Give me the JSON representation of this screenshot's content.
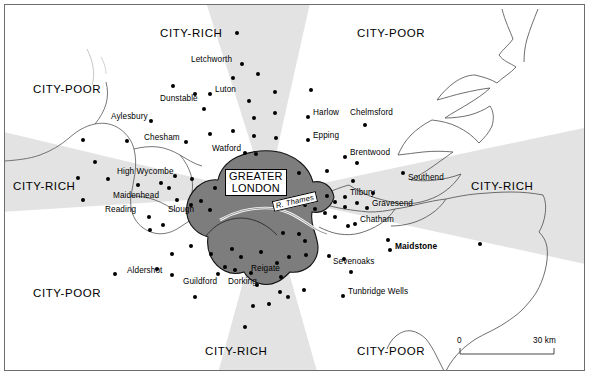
{
  "map": {
    "title": "Greater London and surrounding region — city-rich / city-poor sectors",
    "core_label_line1": "GREATER",
    "core_label_line2": "LONDON",
    "river_label": "R. Thames",
    "colors": {
      "sector_shaded": "#e3e3e3",
      "sector_plain": "#ffffff",
      "core_fill": "#7d7d7d",
      "coastline": "#555555",
      "dot": "#000000",
      "frame": "#6d6d6d"
    },
    "sector_labels": [
      {
        "text": "CITY-RICH",
        "x": 155,
        "y": 22,
        "name": "sector-label-north-city-rich"
      },
      {
        "text": "CITY-POOR",
        "x": 352,
        "y": 22,
        "name": "sector-label-northeast-city-poor"
      },
      {
        "text": "CITY-POOR",
        "x": 28,
        "y": 78,
        "name": "sector-label-northwest-city-poor"
      },
      {
        "text": "CITY-RICH",
        "x": 8,
        "y": 175,
        "name": "sector-label-west-city-rich"
      },
      {
        "text": "CITY-RICH",
        "x": 466,
        "y": 175,
        "name": "sector-label-east-city-rich"
      },
      {
        "text": "CITY-POOR",
        "x": 28,
        "y": 282,
        "name": "sector-label-southwest-city-poor"
      },
      {
        "text": "CITY-RICH",
        "x": 200,
        "y": 340,
        "name": "sector-label-south-city-rich"
      },
      {
        "text": "CITY-POOR",
        "x": 352,
        "y": 340,
        "name": "sector-label-southeast-city-poor"
      }
    ],
    "towns": [
      {
        "name": "Letchworth",
        "lx": 186,
        "ly": 55,
        "dx": 237,
        "dy": 59,
        "align": "right",
        "bold": false
      },
      {
        "name": "Luton",
        "lx": 210,
        "ly": 85,
        "dx": 205,
        "dy": 89,
        "align": "left",
        "bold": false
      },
      {
        "name": "Dunstable",
        "lx": 155,
        "ly": 94,
        "dx": 190,
        "dy": 89,
        "align": "left",
        "bold": false
      },
      {
        "name": "Aylesbury",
        "lx": 106,
        "ly": 112,
        "dx": 146,
        "dy": 116,
        "align": "right",
        "bold": false
      },
      {
        "name": "Chesham",
        "lx": 139,
        "ly": 133,
        "dx": 181,
        "dy": 137,
        "align": "right",
        "bold": false
      },
      {
        "name": "Watford",
        "lx": 207,
        "ly": 144,
        "dx": 240,
        "dy": 148,
        "align": "right",
        "bold": false
      },
      {
        "name": "High Wycombe",
        "lx": 112,
        "ly": 167,
        "dx": 170,
        "dy": 171,
        "align": "left",
        "bold": false
      },
      {
        "name": "Maidenhead",
        "lx": 108,
        "ly": 191,
        "dx": 172,
        "dy": 195,
        "align": "right",
        "bold": false
      },
      {
        "name": "Reading",
        "lx": 100,
        "ly": 205,
        "dx": 144,
        "dy": 212,
        "align": "left",
        "bold": false
      },
      {
        "name": "Slough",
        "lx": 163,
        "ly": 205,
        "dx": 186,
        "dy": 200,
        "align": "left",
        "bold": false
      },
      {
        "name": "Aldershot",
        "lx": 122,
        "ly": 266,
        "dx": 167,
        "dy": 270,
        "align": "right",
        "bold": false
      },
      {
        "name": "Guildford",
        "lx": 178,
        "ly": 277,
        "dx": 213,
        "dy": 269,
        "align": "left",
        "bold": false
      },
      {
        "name": "Dorking",
        "lx": 223,
        "ly": 277,
        "dx": 246,
        "dy": 268,
        "align": "left",
        "bold": false
      },
      {
        "name": "Reigate",
        "lx": 246,
        "ly": 264,
        "dx": 272,
        "dy": 258,
        "align": "left",
        "bold": false
      },
      {
        "name": "Harlow",
        "lx": 308,
        "ly": 108,
        "dx": 303,
        "dy": 112,
        "align": "left",
        "bold": false
      },
      {
        "name": "Epping",
        "lx": 308,
        "ly": 131,
        "dx": 303,
        "dy": 135,
        "align": "left",
        "bold": false
      },
      {
        "name": "Chelmsford",
        "lx": 345,
        "ly": 108,
        "dx": 360,
        "dy": 120,
        "align": "left",
        "bold": false
      },
      {
        "name": "Brentwood",
        "lx": 345,
        "ly": 148,
        "dx": 340,
        "dy": 152,
        "align": "left",
        "bold": false
      },
      {
        "name": "Southend",
        "lx": 403,
        "ly": 173,
        "dx": 398,
        "dy": 168,
        "align": "left",
        "bold": false
      },
      {
        "name": "Tilbury",
        "lx": 345,
        "ly": 188,
        "dx": 340,
        "dy": 192,
        "align": "left",
        "bold": false
      },
      {
        "name": "Gravesend",
        "lx": 367,
        "ly": 199,
        "dx": 362,
        "dy": 203,
        "align": "left",
        "bold": false
      },
      {
        "name": "Chatham",
        "lx": 355,
        "ly": 215,
        "dx": 350,
        "dy": 219,
        "align": "left",
        "bold": false
      },
      {
        "name": "Maistone-marker",
        "lx": 0,
        "ly": 0,
        "dx": 383,
        "dy": 235,
        "align": "none",
        "bold": false
      },
      {
        "name": "Maidstone",
        "lx": 390,
        "ly": 241,
        "dx": 385,
        "dy": 245,
        "align": "left",
        "bold": true
      },
      {
        "name": "Sevenoaks",
        "lx": 328,
        "ly": 257,
        "dx": 324,
        "dy": 251,
        "align": "left",
        "bold": false
      },
      {
        "name": "Tunbridge Wells",
        "lx": 343,
        "ly": 287,
        "dx": 338,
        "dy": 291,
        "align": "left",
        "bold": false
      }
    ],
    "extra_dots": [
      {
        "x": 232,
        "y": 28
      },
      {
        "x": 253,
        "y": 69
      },
      {
        "x": 228,
        "y": 73
      },
      {
        "x": 168,
        "y": 81
      },
      {
        "x": 199,
        "y": 104
      },
      {
        "x": 270,
        "y": 87
      },
      {
        "x": 249,
        "y": 113
      },
      {
        "x": 205,
        "y": 129
      },
      {
        "x": 228,
        "y": 126
      },
      {
        "x": 249,
        "y": 131
      },
      {
        "x": 270,
        "y": 108
      },
      {
        "x": 251,
        "y": 149
      },
      {
        "x": 271,
        "y": 133
      },
      {
        "x": 244,
        "y": 96
      },
      {
        "x": 122,
        "y": 136
      },
      {
        "x": 78,
        "y": 135
      },
      {
        "x": 90,
        "y": 157
      },
      {
        "x": 73,
        "y": 173
      },
      {
        "x": 78,
        "y": 195
      },
      {
        "x": 103,
        "y": 174
      },
      {
        "x": 133,
        "y": 180
      },
      {
        "x": 156,
        "y": 178
      },
      {
        "x": 164,
        "y": 183
      },
      {
        "x": 187,
        "y": 174
      },
      {
        "x": 210,
        "y": 183
      },
      {
        "x": 222,
        "y": 175
      },
      {
        "x": 196,
        "y": 196
      },
      {
        "x": 205,
        "y": 205
      },
      {
        "x": 145,
        "y": 225
      },
      {
        "x": 158,
        "y": 220
      },
      {
        "x": 186,
        "y": 241
      },
      {
        "x": 167,
        "y": 249
      },
      {
        "x": 110,
        "y": 269
      },
      {
        "x": 152,
        "y": 264
      },
      {
        "x": 206,
        "y": 249
      },
      {
        "x": 227,
        "y": 244
      },
      {
        "x": 236,
        "y": 252
      },
      {
        "x": 256,
        "y": 247
      },
      {
        "x": 220,
        "y": 262
      },
      {
        "x": 190,
        "y": 292
      },
      {
        "x": 230,
        "y": 265
      },
      {
        "x": 276,
        "y": 272
      },
      {
        "x": 284,
        "y": 252
      },
      {
        "x": 252,
        "y": 280
      },
      {
        "x": 240,
        "y": 322
      },
      {
        "x": 264,
        "y": 299
      },
      {
        "x": 275,
        "y": 287
      },
      {
        "x": 283,
        "y": 292
      },
      {
        "x": 299,
        "y": 285
      },
      {
        "x": 248,
        "y": 301
      },
      {
        "x": 301,
        "y": 250
      },
      {
        "x": 306,
        "y": 85
      },
      {
        "x": 294,
        "y": 168
      },
      {
        "x": 322,
        "y": 166
      },
      {
        "x": 348,
        "y": 176
      },
      {
        "x": 352,
        "y": 158
      },
      {
        "x": 368,
        "y": 188
      },
      {
        "x": 322,
        "y": 191
      },
      {
        "x": 330,
        "y": 197
      },
      {
        "x": 340,
        "y": 202
      },
      {
        "x": 352,
        "y": 198
      },
      {
        "x": 300,
        "y": 200
      },
      {
        "x": 310,
        "y": 204
      },
      {
        "x": 320,
        "y": 208
      },
      {
        "x": 330,
        "y": 212
      },
      {
        "x": 343,
        "y": 221
      },
      {
        "x": 294,
        "y": 229
      },
      {
        "x": 339,
        "y": 254
      },
      {
        "x": 346,
        "y": 267
      },
      {
        "x": 475,
        "y": 239
      },
      {
        "x": 300,
        "y": 236
      },
      {
        "x": 278,
        "y": 228
      }
    ],
    "scale": {
      "zero": "0",
      "max": "30 km"
    }
  }
}
